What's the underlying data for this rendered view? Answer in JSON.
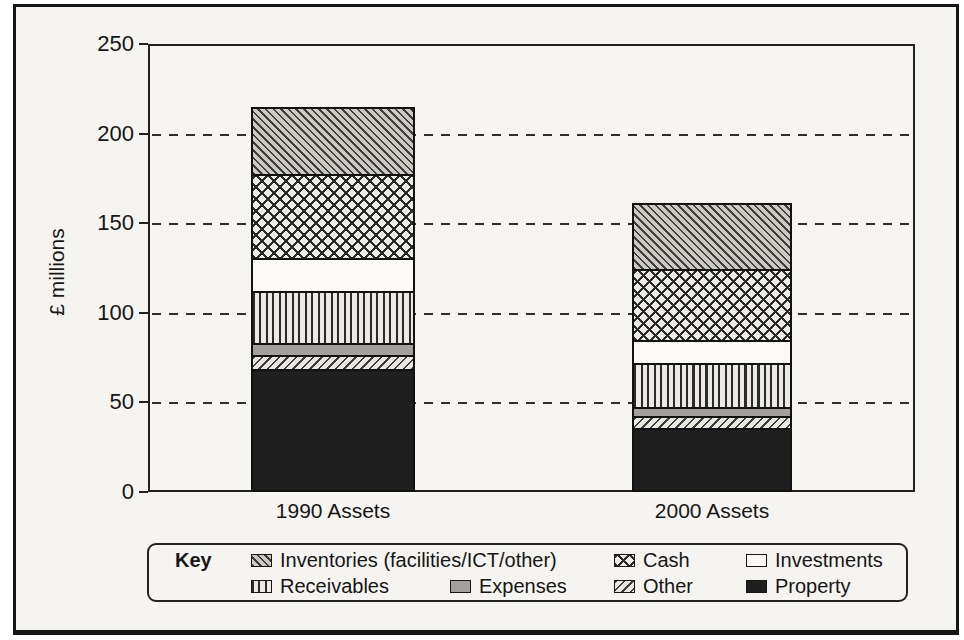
{
  "chart_data": {
    "type": "bar",
    "stacked": true,
    "title": "",
    "ylabel": "£ millions",
    "xlabel": "",
    "ylim": [
      0,
      250
    ],
    "yticks": [
      0,
      50,
      100,
      150,
      200,
      250
    ],
    "gridlines": {
      "values": [
        50,
        100,
        150,
        200
      ],
      "style": "dashed horizontal"
    },
    "categories": [
      "1990 Assets",
      "2000 Assets"
    ],
    "series": [
      {
        "name": "Inventories (facilities/ICT/other)",
        "pattern": "diagonal-backslash-hatch",
        "values": [
          37,
          36
        ]
      },
      {
        "name": "Cash",
        "pattern": "diamond-crosshatch",
        "values": [
          47,
          40
        ]
      },
      {
        "name": "Investments",
        "pattern": "solid-white",
        "values": [
          19,
          13
        ]
      },
      {
        "name": "Receivables",
        "pattern": "vertical-lines",
        "values": [
          29,
          25
        ]
      },
      {
        "name": "Expenses",
        "pattern": "solid-gray",
        "values": [
          7,
          5
        ]
      },
      {
        "name": "Other",
        "pattern": "diagonal-slash-hatch",
        "values": [
          8,
          7
        ]
      },
      {
        "name": "Property",
        "pattern": "solid-black",
        "values": [
          68,
          35
        ]
      }
    ],
    "totals": [
      215,
      161
    ],
    "legend_title": "Key",
    "legend_position": "bottom"
  },
  "colors": {
    "ink": "#161616",
    "paper": "#f5f4f0",
    "solid_gray_fill": "#a3a19c",
    "solid_black_fill": "#1f1f1f",
    "solid_white_fill": "#fbfaf6"
  }
}
